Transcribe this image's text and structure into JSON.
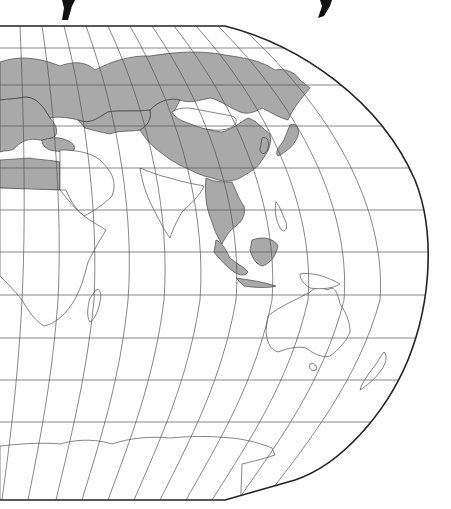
{
  "map": {
    "projection": "Robinson (cropped, eastern hemisphere)",
    "colors": {
      "background": "#ffffff",
      "land_default": "#ffffff",
      "land_highlighted": "#a9a9a9",
      "outline": "#333333",
      "graticule": "#555555",
      "frame": "#222222"
    },
    "highlighted_regions": [
      "Russia",
      "China",
      "Europe",
      "Turkey",
      "Kazakhstan",
      "Egypt",
      "Libya",
      "Japan",
      "North Korea",
      "South Korea",
      "Myanmar",
      "Thailand",
      "Laos",
      "Vietnam",
      "Cambodia",
      "Malaysia",
      "Indonesia",
      "Brunei",
      "Bangladesh"
    ],
    "unhighlighted_regions": [
      "Mongolia",
      "Middle East",
      "Central Asia",
      "India",
      "Africa",
      "Australia",
      "New Zealand",
      "Philippines",
      "Papua New Guinea",
      "Antarctica"
    ],
    "graticule": {
      "parallel_spacing_deg": 15,
      "meridian_spacing_deg": 15
    },
    "top_decoration": {
      "left_bracket": "(",
      "right_bracket": ")"
    }
  }
}
